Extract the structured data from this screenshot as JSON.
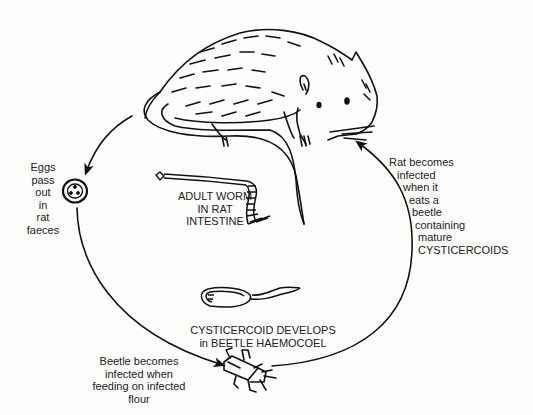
{
  "diagram": {
    "hosts": [
      "rat",
      "beetle"
    ],
    "stages": [
      {
        "id": "adult",
        "lines": [
          "ADULT WORM",
          "IN RAT",
          "INTESTINE"
        ]
      },
      {
        "id": "eggs",
        "lines": [
          "Eggs",
          "pass",
          "out",
          "in",
          "rat",
          "faeces"
        ]
      },
      {
        "id": "beetle",
        "lines": [
          "Beetle becomes",
          "infected when",
          "feeding on infected",
          "flour"
        ]
      },
      {
        "id": "cysticercoid",
        "lines": [
          "CYSTICERCOID DEVELOPS",
          "in BEETLE HAEMOCOEL"
        ]
      },
      {
        "id": "rat_infection",
        "lines": [
          "Rat becomes",
          "infected",
          "when it",
          "eats a",
          "beetle",
          "containing",
          "mature",
          "CYSTICERCOIDS"
        ]
      }
    ],
    "flow": [
      "rat",
      "eggs",
      "beetle",
      "cysticercoid",
      "rat"
    ],
    "line_color": "#111111",
    "background": "#fdfdfb"
  }
}
